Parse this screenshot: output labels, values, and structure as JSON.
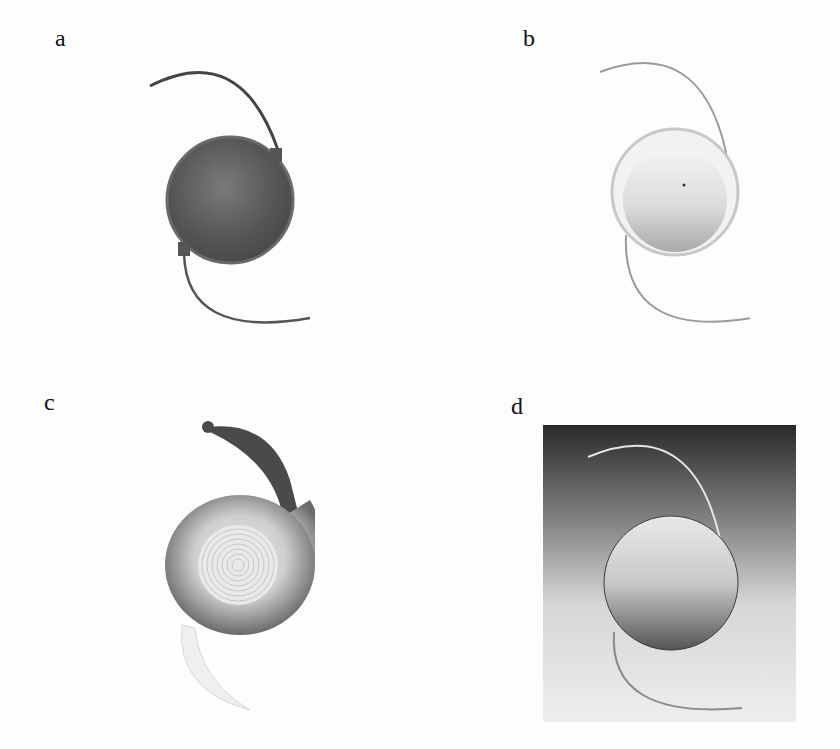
{
  "figure": {
    "panels": [
      {
        "label": "a",
        "description": "Intraocular lens with dark optic and two C-loop haptics"
      },
      {
        "label": "b",
        "description": "Intraocular lens with light optic and two C-loop haptics"
      },
      {
        "label": "c",
        "description": "Diffractive multifocal intraocular lens with concentric rings and broad haptic"
      },
      {
        "label": "d",
        "description": "Intraocular lens on gradient background with two C-loop haptics"
      }
    ]
  }
}
